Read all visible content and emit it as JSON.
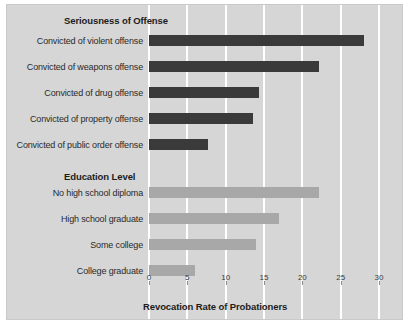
{
  "chart_data": {
    "type": "bar",
    "orientation": "horizontal",
    "title": "",
    "xlabel": "Revocation Rate of  Probationers",
    "ylabel": "",
    "xlim": [
      0,
      30
    ],
    "xticks": [
      0,
      5,
      10,
      15,
      20,
      25,
      30
    ],
    "xtick_labels": [
      "0",
      "5",
      "10",
      "15",
      "20",
      "25",
      "30"
    ],
    "grid": "vertical-white",
    "legend": "none",
    "groups": [
      {
        "heading": "Seriousness of Offense",
        "color": "#3a3a3a",
        "categories": [
          "Convicted of violent offense",
          "Convicted of weapons offense",
          "Convicted of drug offense",
          "Convicted of property offense",
          "Convicted of public order offense"
        ],
        "values": [
          28.0,
          22.2,
          14.3,
          13.6,
          7.7
        ]
      },
      {
        "heading": "Education Level",
        "color": "#a8a8a8",
        "categories": [
          "No high school diploma",
          "High school graduate",
          "Some college",
          "College graduate"
        ],
        "values": [
          22.2,
          17.0,
          14.0,
          6.0
        ]
      }
    ]
  },
  "colors": {
    "plot_background": "#d6d6d6",
    "gridline": "#ffffff",
    "bar_dark": "#3a3a3a",
    "bar_light": "#a8a8a8",
    "text": "#1c1c1c"
  }
}
